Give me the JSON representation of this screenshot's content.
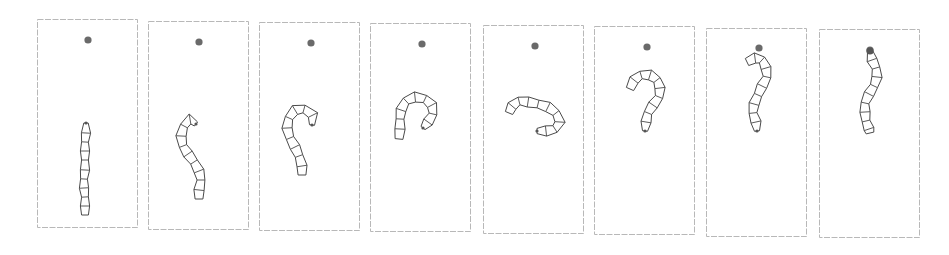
{
  "figure": {
    "frame_count": 8,
    "colors": {
      "frame_border": "#b8b8b8",
      "target": "#6a6a6a",
      "worm_stroke": "#4a4a4a",
      "background": "#ffffff"
    }
  },
  "frames": [
    {
      "x": 37,
      "y": 19,
      "w": 100,
      "h": 208,
      "target": [
        88,
        40
      ],
      "head_dot": false,
      "spine": [
        [
          86,
          123
        ],
        [
          86,
          133
        ],
        [
          85,
          142
        ],
        [
          85,
          151
        ],
        [
          85,
          160
        ],
        [
          85,
          170
        ],
        [
          84,
          179
        ],
        [
          84,
          188
        ],
        [
          85,
          197
        ],
        [
          85,
          206
        ],
        [
          85,
          215
        ]
      ],
      "width": 8
    },
    {
      "x": 148,
      "y": 21,
      "w": 100,
      "h": 208,
      "target": [
        199,
        42
      ],
      "head_dot": false,
      "spine": [
        [
          196,
          124
        ],
        [
          190,
          119
        ],
        [
          184,
          126
        ],
        [
          181,
          136
        ],
        [
          183,
          146
        ],
        [
          188,
          154
        ],
        [
          194,
          162
        ],
        [
          199,
          171
        ],
        [
          201,
          180
        ],
        [
          199,
          190
        ],
        [
          199,
          199
        ]
      ],
      "width": 9
    },
    {
      "x": 259,
      "y": 22,
      "w": 100,
      "h": 208,
      "target": [
        311,
        43
      ],
      "head_dot": false,
      "spine": [
        [
          312,
          125
        ],
        [
          313,
          115
        ],
        [
          304,
          109
        ],
        [
          295,
          110
        ],
        [
          289,
          118
        ],
        [
          287,
          128
        ],
        [
          290,
          138
        ],
        [
          295,
          147
        ],
        [
          299,
          156
        ],
        [
          302,
          166
        ],
        [
          302,
          175
        ]
      ],
      "width": 9
    },
    {
      "x": 370,
      "y": 23,
      "w": 100,
      "h": 208,
      "target": [
        422,
        44
      ],
      "head_dot": false,
      "spine": [
        [
          423,
          128
        ],
        [
          428,
          122
        ],
        [
          433,
          114
        ],
        [
          432,
          105
        ],
        [
          425,
          99
        ],
        [
          415,
          97
        ],
        [
          406,
          101
        ],
        [
          401,
          110
        ],
        [
          400,
          119
        ],
        [
          400,
          129
        ],
        [
          399,
          139
        ]
      ],
      "width": 9
    },
    {
      "x": 483,
      "y": 25,
      "w": 100,
      "h": 208,
      "target": [
        535,
        46
      ],
      "head_dot": false,
      "spine": [
        [
          537,
          131
        ],
        [
          546,
          131
        ],
        [
          555,
          129
        ],
        [
          560,
          122
        ],
        [
          556,
          113
        ],
        [
          548,
          107
        ],
        [
          538,
          104
        ],
        [
          528,
          102
        ],
        [
          519,
          101
        ],
        [
          512,
          106
        ],
        [
          509,
          113
        ]
      ],
      "width": 9
    },
    {
      "x": 594,
      "y": 26,
      "w": 100,
      "h": 208,
      "target": [
        647,
        47
      ],
      "head_dot": false,
      "spine": [
        [
          645,
          131
        ],
        [
          646,
          122
        ],
        [
          648,
          113
        ],
        [
          653,
          105
        ],
        [
          659,
          97
        ],
        [
          660,
          88
        ],
        [
          657,
          80
        ],
        [
          650,
          75
        ],
        [
          641,
          75
        ],
        [
          634,
          80
        ],
        [
          630,
          89
        ]
      ],
      "width": 9
    },
    {
      "x": 706,
      "y": 28,
      "w": 100,
      "h": 208,
      "target": [
        759,
        48
      ],
      "head_dot": false,
      "spine": [
        [
          757,
          131
        ],
        [
          756,
          122
        ],
        [
          753,
          113
        ],
        [
          754,
          104
        ],
        [
          758,
          95
        ],
        [
          762,
          86
        ],
        [
          767,
          77
        ],
        [
          766,
          68
        ],
        [
          762,
          60
        ],
        [
          755,
          58
        ],
        [
          747,
          62
        ]
      ],
      "width": 9
    },
    {
      "x": 819,
      "y": 29,
      "w": 100,
      "h": 208,
      "target": [
        870,
        50
      ],
      "head_dot": true,
      "spine": [
        [
          870,
          51
        ],
        [
          872,
          60
        ],
        [
          876,
          68
        ],
        [
          877,
          77
        ],
        [
          874,
          86
        ],
        [
          869,
          94
        ],
        [
          865,
          103
        ],
        [
          865,
          112
        ],
        [
          866,
          121
        ],
        [
          869,
          129
        ],
        [
          870,
          133
        ]
      ],
      "width": 9
    }
  ]
}
